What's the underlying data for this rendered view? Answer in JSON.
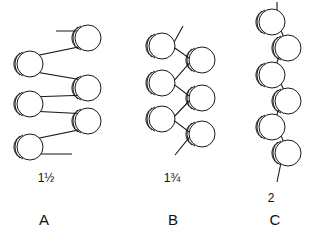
{
  "figure": {
    "background_color": "#ffffff",
    "stroke_color": "#1a1a1a",
    "unit_fill_color": "#ffffff",
    "width": 316,
    "height": 246,
    "panels": [
      {
        "id": "A",
        "panel_label": "A",
        "helix_ratio_label": "1½",
        "helix_ratio_whole": "1",
        "helix_ratio_fraction": "½",
        "description": "flat ribbon zig-zag chain, units alternating far left and far right",
        "unit_count": 6,
        "units": [
          {
            "cx": 88,
            "cy": 38,
            "r": 13
          },
          {
            "cx": 30,
            "cy": 64,
            "r": 13
          },
          {
            "cx": 88,
            "cy": 88,
            "r": 13
          },
          {
            "cx": 30,
            "cy": 104,
            "r": 13
          },
          {
            "cx": 88,
            "cy": 121,
            "r": 13
          },
          {
            "cx": 30,
            "cy": 147,
            "r": 13
          }
        ],
        "backbone_points": "56,31 88,31 88,45 30,57 30,71 88,81 88,95 30,97 30,111 88,114 88,128 30,140 30,154 72,154",
        "terminal_stub_start": "56,31",
        "terminal_stub_end": "72,154"
      },
      {
        "id": "B",
        "panel_label": "B",
        "helix_ratio_label": "1¾",
        "helix_ratio_whole": "1",
        "helix_ratio_fraction": "¾",
        "description": "narrower zig-zag chain with diagonal backbone bonds",
        "unit_count": 6,
        "units": [
          {
            "cx": 162,
            "cy": 46,
            "r": 13
          },
          {
            "cx": 202,
            "cy": 60,
            "r": 13
          },
          {
            "cx": 162,
            "cy": 83,
            "r": 13
          },
          {
            "cx": 202,
            "cy": 98,
            "r": 13
          },
          {
            "cx": 162,
            "cy": 119,
            "r": 13
          },
          {
            "cx": 202,
            "cy": 134,
            "r": 13
          }
        ],
        "backbone_points": "183,26 172,46 192,60 172,83 192,98 172,119 192,134 175,155",
        "terminal_stub_start": "183,26",
        "terminal_stub_end": "175,155"
      },
      {
        "id": "C",
        "panel_label": "C",
        "helix_ratio_label": "2",
        "helix_ratio_whole": "2",
        "helix_ratio_fraction": "",
        "description": "near-vertical two-fold helix, units alternating slightly left and right of the axis",
        "unit_count": 6,
        "units": [
          {
            "cx": 272,
            "cy": 22,
            "r": 13
          },
          {
            "cx": 288,
            "cy": 48,
            "r": 13
          },
          {
            "cx": 272,
            "cy": 75,
            "r": 13
          },
          {
            "cx": 288,
            "cy": 101,
            "r": 13
          },
          {
            "cx": 272,
            "cy": 127,
            "r": 13
          },
          {
            "cx": 288,
            "cy": 153,
            "r": 13
          }
        ],
        "backbone_points": "277,2 277,22 283,35 283,48 277,62 277,75 283,88 283,101 277,114 277,127 283,140 283,153 277,182",
        "terminal_stub_start": "277,2",
        "terminal_stub_end": "277,182"
      }
    ]
  }
}
